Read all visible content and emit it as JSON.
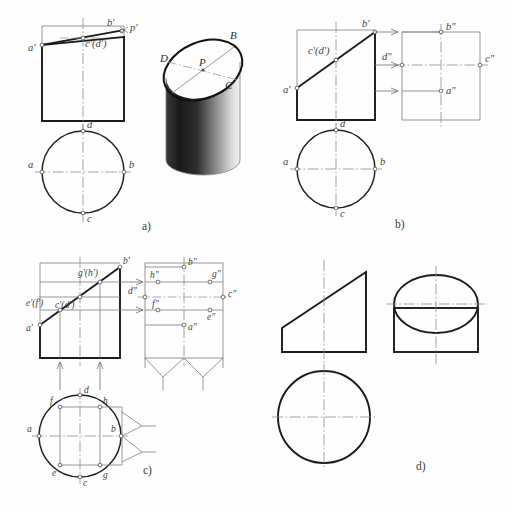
{
  "figure": {
    "caption_bottom": "",
    "background_color": "#fefefe",
    "line_color": "#1b1b1b",
    "thin_line_color": "#7d7d7d",
    "center_line_color": "#8d8d8d"
  },
  "panels": [
    {
      "id": "a",
      "id_label": "a)",
      "description": "Front view with inclined cut line, top view circle, and shaded 3D pictorial of the truncated cylinder",
      "front_view_labels": [
        "a'",
        "c'(d')",
        "b'",
        "p'"
      ],
      "top_view_labels": [
        "d",
        "a",
        "b",
        "c"
      ],
      "pictorial_labels": [
        "B",
        "D",
        "P",
        "C",
        "A"
      ]
    },
    {
      "id": "b",
      "id_label": "b)",
      "description": "Front view, top view circle and side view obtained by projection arrows",
      "front_view_labels": [
        "a'",
        "c'(d')",
        "b'"
      ],
      "side_view_labels": [
        "b\"",
        "d\"",
        "c\"",
        "a\""
      ],
      "top_view_labels": [
        "d",
        "a",
        "b",
        "c"
      ]
    },
    {
      "id": "c",
      "id_label": "c)",
      "description": "Eight-point construction: front view, side view via 45 degree mitre lines, and top view circle",
      "front_view_labels": [
        "a'",
        "e'(f')",
        "c'(d')",
        "g'(h')",
        "b'"
      ],
      "side_view_labels": [
        "b\"",
        "h\"",
        "g\"",
        "d\"",
        "c\"",
        "f\"",
        "a\"",
        "e\""
      ],
      "top_view_labels": [
        "f",
        "d",
        "h",
        "a",
        "b",
        "e",
        "c",
        "g"
      ]
    },
    {
      "id": "d",
      "id_label": "d)",
      "description": "Finished three-view drawing: front view trapezoid, side view with ellipse, top view circle",
      "front_view_labels": [],
      "side_view_labels": [],
      "top_view_labels": []
    }
  ],
  "labels": {
    "a_front_a": "a'",
    "a_front_cd": "c'(d')",
    "a_front_b": "b'",
    "a_front_p": "p'",
    "a_top_d": "d",
    "a_top_a": "a",
    "a_top_b": "b",
    "a_top_c": "c",
    "a_pic_B": "B",
    "a_pic_D": "D",
    "a_pic_P": "P",
    "a_pic_C": "C",
    "a_pic_A": "A",
    "b_front_a": "a'",
    "b_front_cd": "c'(d')",
    "b_front_b": "b'",
    "b_side_b": "b\"",
    "b_side_d": "d\"",
    "b_side_c": "c\"",
    "b_side_a": "a\"",
    "b_top_d": "d",
    "b_top_a": "a",
    "b_top_b": "b",
    "b_top_c": "c",
    "c_front_a": "a'",
    "c_front_ef": "e'(f')",
    "c_front_cd": "c'(d')",
    "c_front_gh": "g'(h')",
    "c_front_b": "b'",
    "c_side_b": "b\"",
    "c_side_h": "h\"",
    "c_side_g": "g\"",
    "c_side_d": "d\"",
    "c_side_c": "c\"",
    "c_side_f": "f\"",
    "c_side_a": "a\"",
    "c_side_e": "e\"",
    "c_top_f": "f",
    "c_top_d": "d",
    "c_top_h": "h",
    "c_top_a": "a",
    "c_top_b": "b",
    "c_top_e": "e",
    "c_top_c": "c",
    "c_top_g": "g",
    "panel_a_id": "a)",
    "panel_b_id": "b)",
    "panel_c_id": "c)",
    "panel_d_id": "d)"
  }
}
